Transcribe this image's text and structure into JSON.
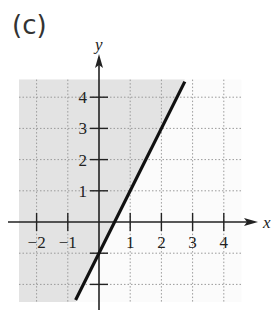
{
  "panel_label": "(c)",
  "colors": {
    "shade": "#e3e3e3",
    "background": "#fbfbfb",
    "grid": "#9a9a9a",
    "axis": "#222222",
    "line": "#111111"
  },
  "chart_data": {
    "type": "line",
    "title": "",
    "xlabel": "x",
    "ylabel": "y",
    "xlim": [
      -2.5,
      4.5
    ],
    "ylim": [
      -2.5,
      4.5
    ],
    "grid": true,
    "x_ticks": [
      -2,
      -1,
      1,
      2,
      3,
      4
    ],
    "y_ticks": [
      1,
      2,
      3,
      4
    ],
    "x_tick_labels": [
      "−2",
      "−1",
      "1",
      "2",
      "3",
      "4"
    ],
    "y_tick_labels": [
      "1",
      "2",
      "3",
      "4"
    ],
    "series": [
      {
        "name": "boundary y = 2x − 1",
        "style": "solid",
        "points": [
          [
            -0.75,
            -2.5
          ],
          [
            2.75,
            4.5
          ]
        ]
      }
    ],
    "shaded_region": {
      "description": "y ≥ 2x − 1 (region above/left of line)",
      "polygon": [
        [
          -2.5,
          -2.5
        ],
        [
          -0.75,
          -2.5
        ],
        [
          2.75,
          4.5
        ],
        [
          -2.5,
          4.5
        ]
      ]
    }
  }
}
